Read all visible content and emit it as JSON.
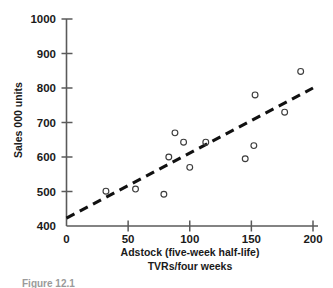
{
  "chart_data": {
    "type": "scatter",
    "title": "",
    "xlabel": "Adstock (five-week half-life) TVRs/four weeks",
    "xlabel_line1": "Adstock (five-week half-life)",
    "xlabel_line2": "TVRs/four weeks",
    "ylabel": "Sales 000 units",
    "xlim": [
      0,
      200
    ],
    "ylim": [
      400,
      1000
    ],
    "xticks": [
      0,
      50,
      100,
      150,
      200
    ],
    "yticks": [
      400,
      500,
      600,
      700,
      800,
      900,
      1000
    ],
    "xtick_labels": [
      "0",
      "50",
      "100",
      "150",
      "200"
    ],
    "ytick_labels": [
      "400",
      "500",
      "600",
      "700",
      "800",
      "900",
      "1000"
    ],
    "grid": false,
    "legend": "none",
    "marker": "open-circle",
    "points": [
      {
        "x": 32,
        "y": 501
      },
      {
        "x": 56,
        "y": 507
      },
      {
        "x": 79,
        "y": 492
      },
      {
        "x": 83,
        "y": 600
      },
      {
        "x": 88,
        "y": 670
      },
      {
        "x": 95,
        "y": 643
      },
      {
        "x": 100,
        "y": 570
      },
      {
        "x": 113,
        "y": 643
      },
      {
        "x": 145,
        "y": 595
      },
      {
        "x": 152,
        "y": 633
      },
      {
        "x": 153,
        "y": 780
      },
      {
        "x": 177,
        "y": 730
      },
      {
        "x": 190,
        "y": 848
      }
    ],
    "trend_line": {
      "style": "dashed",
      "x0": 0,
      "y0": 423,
      "x1": 200,
      "y1": 800
    }
  },
  "caption": {
    "partial_text": "Figure 12.1"
  },
  "colors": {
    "axis": "#5a5a5a",
    "marker": "#3d3d3d",
    "trend": "#111111",
    "text": "#1a1a1a",
    "background": "#ffffff"
  }
}
